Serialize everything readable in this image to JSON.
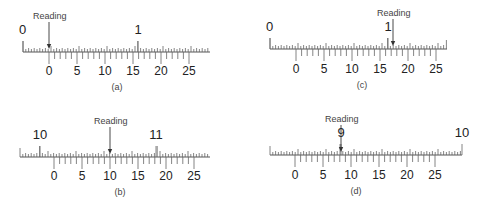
{
  "figure": {
    "panels": [
      {
        "id": "a",
        "caption": "(a)",
        "reading_label": "Reading",
        "main_scale": {
          "start_x": 23,
          "end_x": 210,
          "baseline_y": 52,
          "minor_step": 2.8,
          "labels": [
            {
              "text": "0",
              "x": 23
            },
            {
              "text": "1",
              "x": 138
            }
          ]
        },
        "vernier": {
          "zero_x": 49,
          "unit_px": 5.6,
          "label_y": 75,
          "labels": [
            "0",
            "5",
            "10",
            "15",
            "20",
            "25"
          ]
        },
        "arrow_x": 49,
        "reading_text_x": 33,
        "caption_x": 117
      },
      {
        "id": "b",
        "caption": "(b)",
        "reading_label": "Reading",
        "main_scale": {
          "start_x": 20,
          "end_x": 210,
          "baseline_y": 157,
          "minor_step": 2.8,
          "labels": [
            {
              "text": "10",
              "x": 40
            },
            {
              "text": "11",
              "x": 156
            }
          ]
        },
        "vernier": {
          "zero_x": 54,
          "unit_px": 5.6,
          "label_y": 180,
          "labels": [
            "0",
            "5",
            "10",
            "15",
            "20",
            "25"
          ]
        },
        "arrow_x": 110,
        "reading_text_x": 94,
        "caption_x": 120
      },
      {
        "id": "c",
        "caption": "(c)",
        "reading_label": "Reading",
        "main_scale": {
          "start_x": 270,
          "end_x": 447,
          "baseline_y": 49,
          "minor_step": 2.8,
          "labels": [
            {
              "text": "0",
              "x": 270
            },
            {
              "text": "1",
              "x": 388
            }
          ]
        },
        "vernier": {
          "zero_x": 296,
          "unit_px": 5.6,
          "label_y": 73,
          "labels": [
            "0",
            "5",
            "10",
            "15",
            "20",
            "25"
          ]
        },
        "arrow_x": 393,
        "reading_text_x": 377,
        "caption_x": 362
      },
      {
        "id": "d",
        "caption": "(d)",
        "reading_label": "Reading",
        "main_scale": {
          "start_x": 270,
          "end_x": 462,
          "baseline_y": 155,
          "minor_step": 2.8,
          "labels": [
            {
              "text": "9",
              "x": 341
            },
            {
              "text": "10",
              "x": 462
            }
          ]
        },
        "vernier": {
          "zero_x": 295,
          "unit_px": 5.6,
          "label_y": 179,
          "labels": [
            "0",
            "5",
            "10",
            "15",
            "20",
            "25"
          ]
        },
        "arrow_x": 341,
        "reading_text_x": 325,
        "caption_x": 356
      }
    ]
  }
}
